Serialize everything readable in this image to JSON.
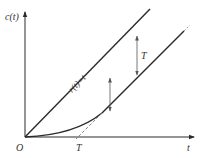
{
  "diagram": {
    "type": "ramp-response",
    "axes": {
      "y_label": "c(t)",
      "x_label": "t",
      "origin_label": "O"
    },
    "input": {
      "label": "r(t)=t"
    },
    "annotations": {
      "lag_label_vertical": "T",
      "lag_label_horizontal": "T"
    },
    "colors": {
      "stroke": "#2a2a2a",
      "arrow": "#555555",
      "dashed": "#777777"
    }
  }
}
